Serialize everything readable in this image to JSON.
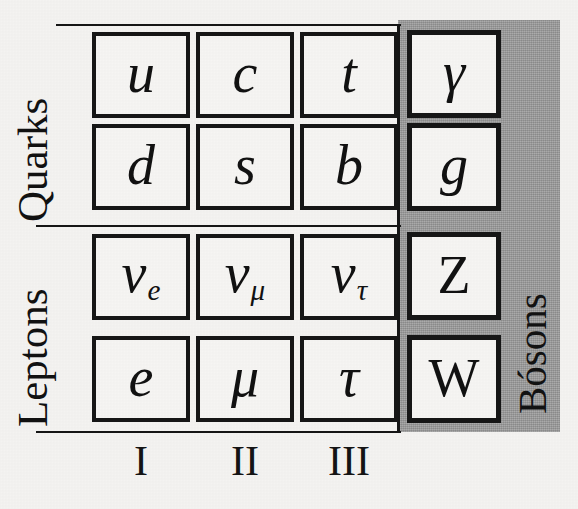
{
  "figure": {
    "background_color": "#f4f3f1",
    "panel_color": "#9b9b9b",
    "ink_color": "#111111"
  },
  "row_labels": {
    "quarks": "Quarks",
    "leptons": "Leptons",
    "bosons": "Bósons"
  },
  "generation_labels": [
    "I",
    "II",
    "III"
  ],
  "chart_data": {
    "type": "table",
    "row_groups": [
      "Quarks",
      "Leptons"
    ],
    "column_groups": [
      "I",
      "II",
      "III",
      "Bósons"
    ],
    "fermions": {
      "rows": [
        {
          "group": "Quarks",
          "cells": [
            {
              "symbol": "u",
              "sub": ""
            },
            {
              "symbol": "c",
              "sub": ""
            },
            {
              "symbol": "t",
              "sub": ""
            }
          ]
        },
        {
          "group": "Quarks",
          "cells": [
            {
              "symbol": "d",
              "sub": ""
            },
            {
              "symbol": "s",
              "sub": ""
            },
            {
              "symbol": "b",
              "sub": ""
            }
          ]
        },
        {
          "group": "Leptons",
          "cells": [
            {
              "symbol": "ν",
              "sub": "e"
            },
            {
              "symbol": "ν",
              "sub": "μ"
            },
            {
              "symbol": "ν",
              "sub": "τ"
            }
          ]
        },
        {
          "group": "Leptons",
          "cells": [
            {
              "symbol": "e",
              "sub": ""
            },
            {
              "symbol": "μ",
              "sub": ""
            },
            {
              "symbol": "τ",
              "sub": ""
            }
          ]
        }
      ]
    },
    "bosons": {
      "cells": [
        {
          "symbol": "γ",
          "style": "italic"
        },
        {
          "symbol": "g",
          "style": "italic"
        },
        {
          "symbol": "Z",
          "style": "upright"
        },
        {
          "symbol": "W",
          "style": "upright"
        }
      ]
    }
  }
}
